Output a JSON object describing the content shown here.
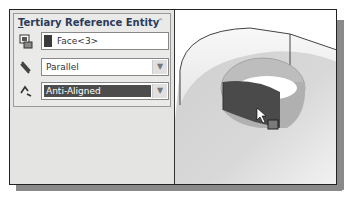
{
  "panel": {
    "title_prefix": "T",
    "title_rest": "ertiary Reference Entity",
    "collapse_icon": "double-chevron-up-icon",
    "face_field": {
      "value": "Face<3>",
      "swatch_color": "#3a3a3a"
    },
    "relation_select": {
      "value": "Parallel"
    },
    "alignment_select": {
      "value": "Anti-Aligned"
    }
  },
  "viewport": {
    "description": "3D model view with cylindrical cut face selected",
    "cursor": "arrow-cursor"
  }
}
